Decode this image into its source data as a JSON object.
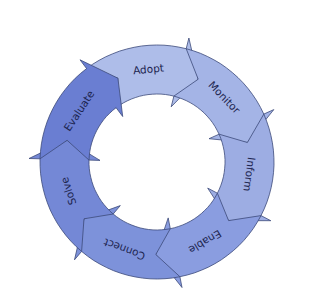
{
  "diagram": {
    "type": "cycle",
    "center": [
      157,
      162
    ],
    "outer_radius": 117,
    "inner_radius": 68,
    "start_angle": -37,
    "segments": [
      {
        "label": "Adopt",
        "color": "#aebde9"
      },
      {
        "label": "Monitor",
        "color": "#a4b4e6"
      },
      {
        "label": "Inform",
        "color": "#9dade3"
      },
      {
        "label": "Enable",
        "color": "#8a9de0"
      },
      {
        "label": "Connect",
        "color": "#7d92da"
      },
      {
        "label": "Solve",
        "color": "#7488d6"
      },
      {
        "label": "Evaluate",
        "color": "#6a7ed2"
      }
    ],
    "stroke_color": "#3c4a7a",
    "text_color": "#1d2550"
  }
}
